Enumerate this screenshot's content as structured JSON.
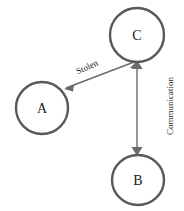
{
  "diagram": {
    "type": "node-edge-graph",
    "background_color": "#ffffff",
    "node_stroke_color": "#595959",
    "edge_color": "#6b6b6b",
    "label_color": "#1a1a1a",
    "nodes": [
      {
        "id": "A",
        "label": "A",
        "cx": 42,
        "cy": 108,
        "rx": 26,
        "ry": 26
      },
      {
        "id": "B",
        "label": "B",
        "cx": 138,
        "cy": 180,
        "rx": 26,
        "ry": 25
      },
      {
        "id": "C",
        "label": "C",
        "cx": 137,
        "cy": 35,
        "rx": 27,
        "ry": 27
      }
    ],
    "edges": [
      {
        "id": "edge-stolen",
        "label": "Stolen",
        "from": "C",
        "to": "A",
        "direction": "one-way",
        "label_rotation_deg": -25,
        "label_x": 87,
        "label_y": 67
      },
      {
        "id": "edge-communication",
        "label": "Communication",
        "from": "C",
        "to": "B",
        "direction": "two-way",
        "label_rotation_deg": -90,
        "label_x": 170,
        "label_y": 106
      }
    ]
  }
}
